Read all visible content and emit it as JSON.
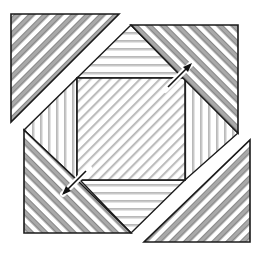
{
  "figure": {
    "width": 264,
    "height": 257,
    "colors": {
      "background": "#ffffff",
      "outline": "#1a1a1a",
      "dark_stripe": "#a9a9a9",
      "light_stripe": "#c8c8c8",
      "stripe_gap": "#ffffff"
    },
    "regions": [
      {
        "name": "top-left-triangle",
        "hatch": "thick-diagonal-up",
        "points": "11,14 119,14 11,122"
      },
      {
        "name": "bottom-right-triangle",
        "hatch": "thick-diagonal-up",
        "points": "250,140 250,242 144,242"
      },
      {
        "name": "top-right-blade",
        "hatch": "thick-diagonal-down",
        "points": "131,25 238,25 238,133 183,78"
      },
      {
        "name": "bottom-left-blade",
        "hatch": "thick-diagonal-down",
        "points": "24,130 80,180 131,233 24,233"
      },
      {
        "name": "top-strip",
        "hatch": "horizontal",
        "points": "131,25 183,78 77,78"
      },
      {
        "name": "bottom-strip",
        "hatch": "horizontal",
        "points": "80,180 185,180 131,233"
      },
      {
        "name": "left-strip",
        "hatch": "vertical",
        "points": "77,78 77,180 24,130"
      },
      {
        "name": "right-strip",
        "hatch": "vertical",
        "points": "185,80 238,133 185,180"
      },
      {
        "name": "center-square",
        "hatch": "thin-diagonal-up",
        "points": "77,78 185,78 185,180 77,180"
      }
    ],
    "markers": [
      {
        "name": "top-right-arrow",
        "direction": "up-right",
        "x": 175,
        "y": 72
      },
      {
        "name": "bottom-left-arrow",
        "direction": "down-left",
        "x": 72,
        "y": 180
      }
    ]
  }
}
